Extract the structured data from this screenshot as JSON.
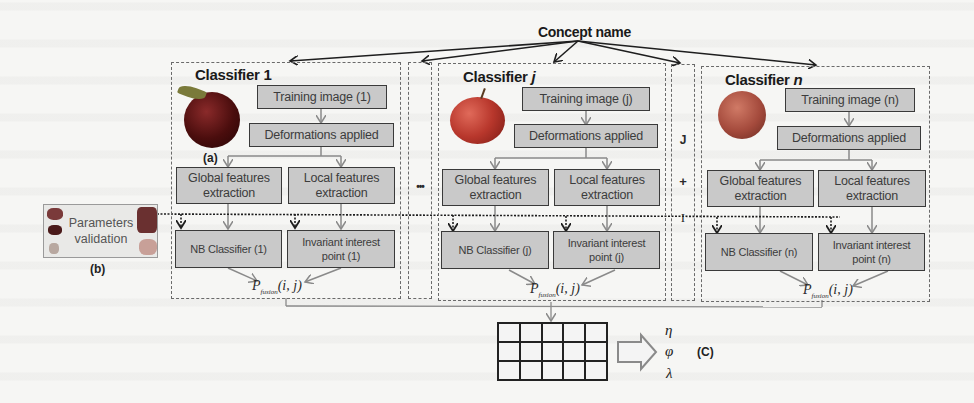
{
  "diagram": {
    "concept_name": "Concept name",
    "classifiers": [
      {
        "id": "1",
        "title_prefix": "Classifier",
        "title_index": "1",
        "training_image": "Training image  (1)",
        "deformations": "Deformations applied",
        "global_features_line1": "Global features",
        "global_features_line2": "extraction",
        "local_features_line1": "Local features",
        "local_features_line2": "extraction",
        "nb_classifier": "NB Classifier  (1)",
        "invariant_line1": "Invariant interest",
        "invariant_line2": "point (1)",
        "apple_color": "#5a1010",
        "image_label": "(a)"
      },
      {
        "id": "j",
        "title_prefix": "Classifier",
        "title_index": "j",
        "training_image": "Training image  (j)",
        "deformations": "Deformations applied",
        "global_features_line1": "Global features",
        "global_features_line2": "extraction",
        "local_features_line1": "Local features",
        "local_features_line2": "extraction",
        "nb_classifier": "NB Classifier  (j)",
        "invariant_line1": "Invariant interest",
        "invariant_line2": "point (j)",
        "apple_color": "#b8372c"
      },
      {
        "id": "n",
        "title_prefix": "Classifier",
        "title_index": "n",
        "training_image": "Training image (n)",
        "deformations": "Deformations applied",
        "global_features_line1": "Global features",
        "global_features_line2": "extraction",
        "local_features_line1": "Local features",
        "local_features_line2": "extraction",
        "nb_classifier": "NB Classifier  (n)",
        "invariant_line1": "Invariant interest",
        "invariant_line2": "point (n)",
        "apple_color": "#a44a3c"
      }
    ],
    "ellipsis": "•••",
    "jplus_column": [
      "J",
      "+",
      "I"
    ],
    "fusion": {
      "symbol": "P",
      "subscript": "fusion",
      "args": "(i, j)"
    },
    "parameters_validation": {
      "line1": "Parameters",
      "line2": "validation",
      "label": "(b)"
    },
    "output": {
      "grid_rows": 3,
      "grid_cols": 5,
      "params": [
        "η",
        "φ",
        "λ"
      ],
      "label": "(C)"
    }
  },
  "colors": {
    "box_fill": "#c9c9c9",
    "box_border": "#3a3a3a",
    "flow_arrow": "#8a8a8a",
    "dashed": "#6a6a6a",
    "background": "#f6f6f4"
  }
}
